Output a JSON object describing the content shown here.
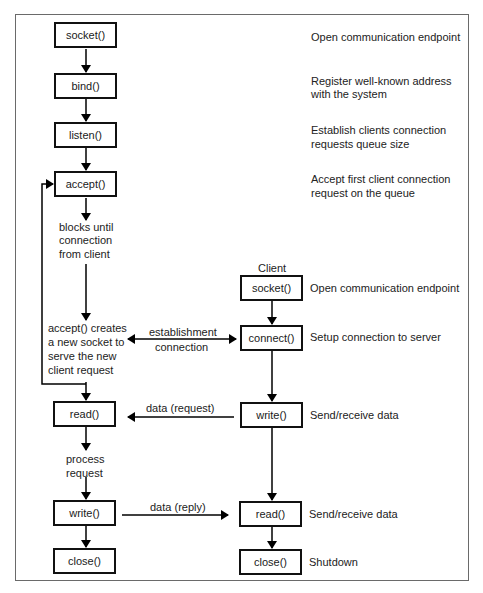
{
  "server": {
    "socket": "socket()",
    "bind": "bind()",
    "listen": "listen()",
    "accept": "accept()",
    "read": "read()",
    "write": "write()",
    "close": "close()"
  },
  "client": {
    "label": "Client",
    "socket": "socket()",
    "connect": "connect()",
    "write": "write()",
    "read": "read()",
    "close": "close()"
  },
  "descriptions": {
    "server_socket": "Open communication endpoint",
    "bind_line1": "Register well-known address",
    "bind_line2": "with the system",
    "listen_line1": "Establish clients connection",
    "listen_line2": "requests queue size",
    "accept_line1": "Accept first client connection",
    "accept_line2": "request on the queue",
    "client_socket": "Open communication endpoint",
    "connect": "Setup connection to server",
    "client_write": "Send/receive data",
    "client_read": "Send/receive data",
    "client_close": "Shutdown"
  },
  "notes": {
    "blocks_line1": "blocks until",
    "blocks_line2": "connection",
    "blocks_line3": "from client",
    "accept_creates_line1": "accept() creates",
    "accept_creates_line2": "a new socket to",
    "accept_creates_line3": "serve the new",
    "accept_creates_line4": "client request",
    "process_line1": "process",
    "process_line2": "request"
  },
  "arrows": {
    "establishment_line1": "establishment",
    "establishment_line2": "connection",
    "data_request": "data (request)",
    "data_reply": "data (reply)"
  }
}
